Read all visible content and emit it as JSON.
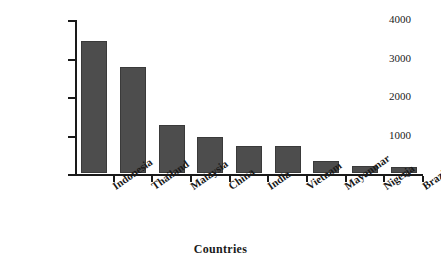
{
  "chart_data": {
    "type": "bar",
    "title": "",
    "subtitle": "",
    "xlabel": "Countries",
    "ylabel": "Area in '000 ha",
    "categories": [
      "Indonesia",
      "Thailand",
      "Malaysia",
      "China",
      "India",
      "Vietnam",
      "Mayanmar",
      "Nigeria",
      "Brazil"
    ],
    "values": [
      3420,
      2750,
      1250,
      940,
      700,
      690,
      300,
      180,
      160
    ],
    "series": [
      {
        "name": "Area",
        "values": [
          3420,
          2750,
          1250,
          940,
          700,
          690,
          300,
          180,
          160
        ]
      }
    ],
    "ylim": [
      0,
      4000
    ],
    "ytick_labels": [
      "0",
      "1000",
      "2000",
      "3000",
      "4000"
    ],
    "ytick_values": [
      0,
      1000,
      2000,
      3000,
      4000
    ],
    "grid": false,
    "legend": false,
    "legend_position": "none",
    "bar_color": "#4d4d4d",
    "bar_edge_color": "#3a3a3a",
    "axis_color": "#1a1a1a",
    "background_color": "#ffffff",
    "annotations": []
  }
}
